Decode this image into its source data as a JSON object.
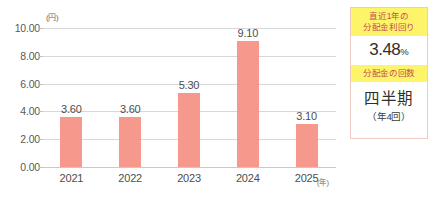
{
  "chart_data": {
    "type": "bar",
    "title": "",
    "xlabel": "(年)",
    "ylabel": "(円)",
    "categories": [
      "2021",
      "2022",
      "2023",
      "2024",
      "2025"
    ],
    "values": [
      3.6,
      3.6,
      5.3,
      9.1,
      3.1
    ],
    "value_labels": [
      "3.60",
      "3.60",
      "5.30",
      "9.10",
      "3.10"
    ],
    "ylim": [
      0.0,
      10.0
    ],
    "y_ticks": [
      "10.00",
      "8.00",
      "6.00",
      "4.00",
      "2.00",
      "0.00"
    ],
    "y_tick_values": [
      10,
      8,
      6,
      4,
      2,
      0
    ],
    "grid": true,
    "legend": "none",
    "bar_color": "#f6998c",
    "grid_color": "#d8d8d8"
  },
  "info_card": {
    "yield": {
      "header_line1": "直近1年の",
      "header_line2": "分配金利回り",
      "value": "3.48",
      "unit": "%"
    },
    "frequency": {
      "header_line1": "分配金の回数",
      "value": "四半期",
      "sub": "（年4回）"
    },
    "header_bg": "#fdf46a",
    "header_text_color": "#c44b52",
    "border_color": "#f3c9c4"
  }
}
